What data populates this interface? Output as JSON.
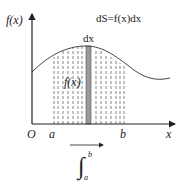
{
  "diagram": {
    "y_axis_label": "f(x)",
    "x_axis_label": "x",
    "origin_label": "O",
    "formula": "dS=f(x)dx",
    "strip_label": "dx",
    "curve_label": "f(x)",
    "lower_bound_label": "a",
    "upper_bound_label": "b",
    "integral": {
      "symbol": "∫",
      "upper_limit": "b",
      "lower_limit": "a"
    },
    "colors": {
      "axis": "#222222",
      "curve": "#444444",
      "dashes": "#666666",
      "strip_fill": "#9a9a9a",
      "strip_edge": "#555555"
    }
  }
}
